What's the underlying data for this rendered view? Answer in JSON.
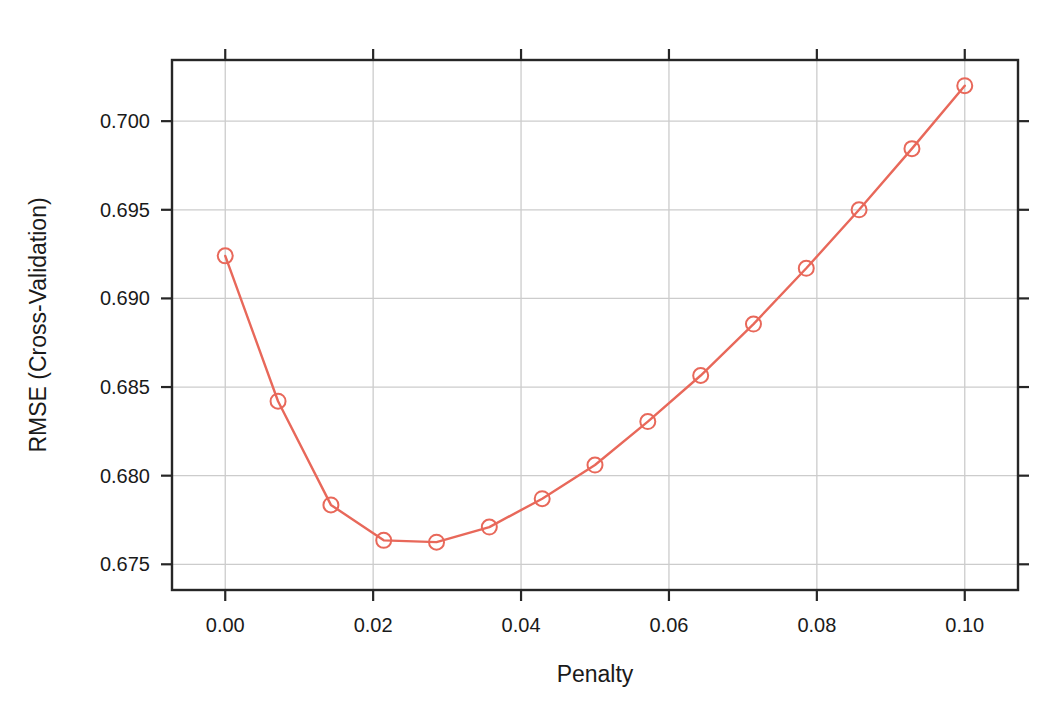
{
  "chart_data": {
    "type": "line",
    "title": "",
    "subtitle": "",
    "xlabel": "Penalty",
    "ylabel": "RMSE (Cross-Validation)",
    "xlim": [
      -0.0072,
      0.1072
    ],
    "ylim": [
      0.67355,
      0.70345
    ],
    "xticks": [
      0.0,
      0.02,
      0.04,
      0.06,
      0.08,
      0.1
    ],
    "xticklabels": [
      "0.00",
      "0.02",
      "0.04",
      "0.06",
      "0.08",
      "0.10"
    ],
    "yticks": [
      0.675,
      0.68,
      0.685,
      0.69,
      0.695,
      0.7
    ],
    "yticklabels": [
      "0.675",
      "0.680",
      "0.685",
      "0.690",
      "0.695",
      "0.700"
    ],
    "grid": true,
    "legend": null,
    "marker": "open-circle",
    "series": [
      {
        "name": "RMSE",
        "color": "#E8685A",
        "x": [
          0.0,
          0.00714,
          0.01429,
          0.02143,
          0.02857,
          0.03571,
          0.04286,
          0.05,
          0.05714,
          0.06429,
          0.07143,
          0.07857,
          0.08571,
          0.09286,
          0.1
        ],
        "y": [
          0.6924,
          0.6842,
          0.67835,
          0.67635,
          0.67625,
          0.6771,
          0.6787,
          0.6806,
          0.68305,
          0.68565,
          0.68855,
          0.6917,
          0.695,
          0.69845,
          0.702
        ]
      }
    ],
    "annotations": []
  },
  "style": {
    "line_color": "#E8685A",
    "marker_color": "#E8685A",
    "grid_color": "#CCCCCC",
    "frame_color": "#262626",
    "text_color": "#1a1a1a",
    "background": "#FFFFFF"
  },
  "geometry": {
    "plot_left": 172,
    "plot_right": 1018,
    "plot_top": 60,
    "plot_bottom": 590
  }
}
